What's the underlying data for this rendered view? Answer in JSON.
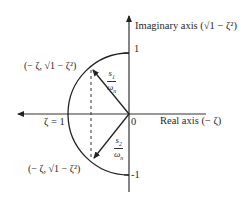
{
  "diagram": {
    "type": "s-plane unit circle (damping ratio geometry)",
    "axes": {
      "imaginary_label": "Imaginary axis (",
      "imaginary_expr": "√1 − ζ²",
      "imaginary_close": ")",
      "real_label": "Real axis (− ζ)",
      "tick_top": "1",
      "tick_bottom": "-1",
      "origin": "0",
      "zeta_one": "ζ = 1"
    },
    "points": {
      "upper": "(− ζ, √1 − ζ²)",
      "lower": "(− ζ, √1 − ζ²)"
    },
    "vectors": {
      "s1_num": "s",
      "s1_sub": "1",
      "s1_den": "ω",
      "s1_den_sub": "n",
      "s2_num": "s",
      "s2_sub": "2",
      "s2_den": "ω",
      "s2_den_sub": "n"
    },
    "colors": {
      "stroke": "#222222",
      "axis": "#333333"
    }
  }
}
